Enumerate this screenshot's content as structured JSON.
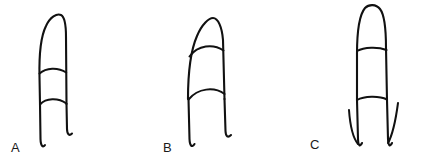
{
  "figure": {
    "background_color": "#ffffff",
    "ink_color": "#111111",
    "width": 422,
    "height": 164,
    "panels": [
      {
        "id": "a",
        "label": "A",
        "label_x": 11,
        "label_y": 141,
        "description": "finger outline with rounded tip and two joint creases, base lines hooked outward",
        "tip_shape": "rounded-dome",
        "crease_count": 2,
        "crease_style": "shallow-arch",
        "base_style": "hooked-ends",
        "outline_path": "M 40 104 L 39.5 77 C 39 55 40 38 46 26 C 50 17 57 13 61 15 C 65 17 66 26 66 37 L 66.5 104",
        "crease_paths": [
          "M 39.5 73.5 C 46 67.5 58 67 66.2 72.5",
          "M 40 104.5 C 46 98 58 97.5 66.4 103.5"
        ],
        "base_paths": [
          "M 40 104 L 40.5 139 C 40.7 146 43 148 45 145",
          "M 66.5 104 L 67 129 C 67.2 135 69.5 136 72 133.5"
        ],
        "slivers": []
      },
      {
        "id": "b",
        "label": "B",
        "label_x": 163,
        "label_y": 141,
        "description": "finger outline with pointed tip and two arched joint creases, base lines hooked outward",
        "tip_shape": "peaked-dome",
        "crease_count": 2,
        "crease_style": "high-arch",
        "base_style": "hooked-ends",
        "outline_path": "M 188 99 C 188 78 190 52 197 36 C 202 24 209 18 213 18 C 218 18 222 27 223 40 L 224.5 99",
        "crease_paths": [
          "M 189.5 56.5 C 198 45 213 43.5 223.5 50.5",
          "M 188.5 99.5 C 198 88 214 86.5 224.6 94"
        ],
        "base_paths": [
          "M 188.5 99 L 189.5 139 C 189.8 146 192 148 194.5 144",
          "M 224.5 99 L 225.5 131 C 225.8 137 228 138 231 135"
        ],
        "slivers": []
      },
      {
        "id": "c",
        "label": "C",
        "label_x": 310,
        "label_y": 138,
        "description": "narrow finger with rounded tip, two creases, and two detached outward splayed base slivers",
        "tip_shape": "narrow-dome",
        "crease_count": 2,
        "crease_style": "near-straight",
        "base_style": "split-slivers",
        "outline_path": "M 357 100 L 357 54 C 357 30 360 14 365 8 C 369 4 376 4 380 9 C 384 14 386 28 386 48 L 387 100",
        "crease_paths": [
          "M 357 51 C 364 47 378 46.5 386.5 50",
          "M 357 100 C 364 96 379 95.5 387 99.5"
        ],
        "base_paths": [
          "M 357 100 L 358 139 C 358.3 146 360 147 362 143",
          "M 387 100 L 388 139 C 388.3 146 390 147 392 143"
        ],
        "slivers": [
          "M 349 110 C 350 124 353 138 358 144",
          "M 398 103 C 396 118 393 134 388 143"
        ]
      }
    ]
  }
}
